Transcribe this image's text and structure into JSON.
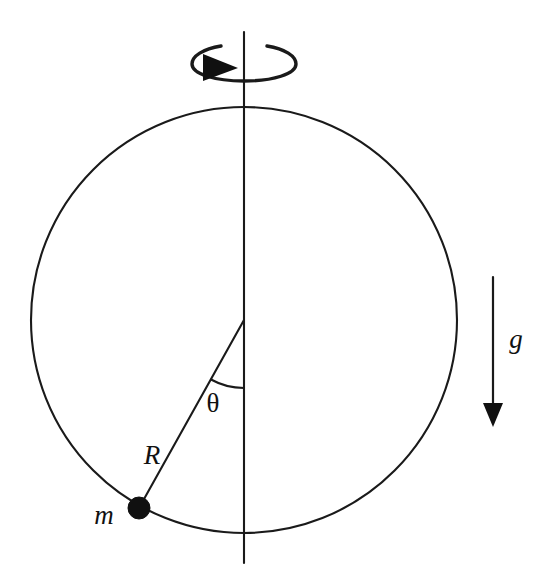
{
  "figure": {
    "background_color": "#ffffff",
    "ink_color": "#1a1a1a",
    "width": 556,
    "height": 579
  },
  "labels": {
    "angle": "θ",
    "radius": "R",
    "mass": "m",
    "gravity": "g"
  },
  "geometry": {
    "circle": {
      "cx": 244,
      "cy": 320,
      "r": 213
    },
    "axis": {
      "x": 244,
      "y_top": 32,
      "y_bottom": 563
    },
    "center_point": {
      "x": 244,
      "y": 320
    },
    "mass_point": {
      "x": 139,
      "y": 508,
      "dot_radius": 11
    },
    "theta_degrees": 29,
    "angle_arc_radius": 68,
    "gravity_arrow": {
      "x": 493,
      "y_start": 277,
      "y_end": 427
    },
    "spin_arrow": {
      "cx": 244,
      "cy": 61,
      "rx": 40,
      "ry": 17
    }
  },
  "label_positions": {
    "angle": {
      "x": 213,
      "y": 406
    },
    "radius": {
      "x": 152,
      "y": 458
    },
    "mass": {
      "x": 104,
      "y": 518
    },
    "gravity": {
      "x": 516,
      "y": 342
    }
  },
  "icons": {
    "spin": "rotation-arrow-icon",
    "gravity": "down-arrow-icon",
    "mass": "filled-dot-icon"
  }
}
